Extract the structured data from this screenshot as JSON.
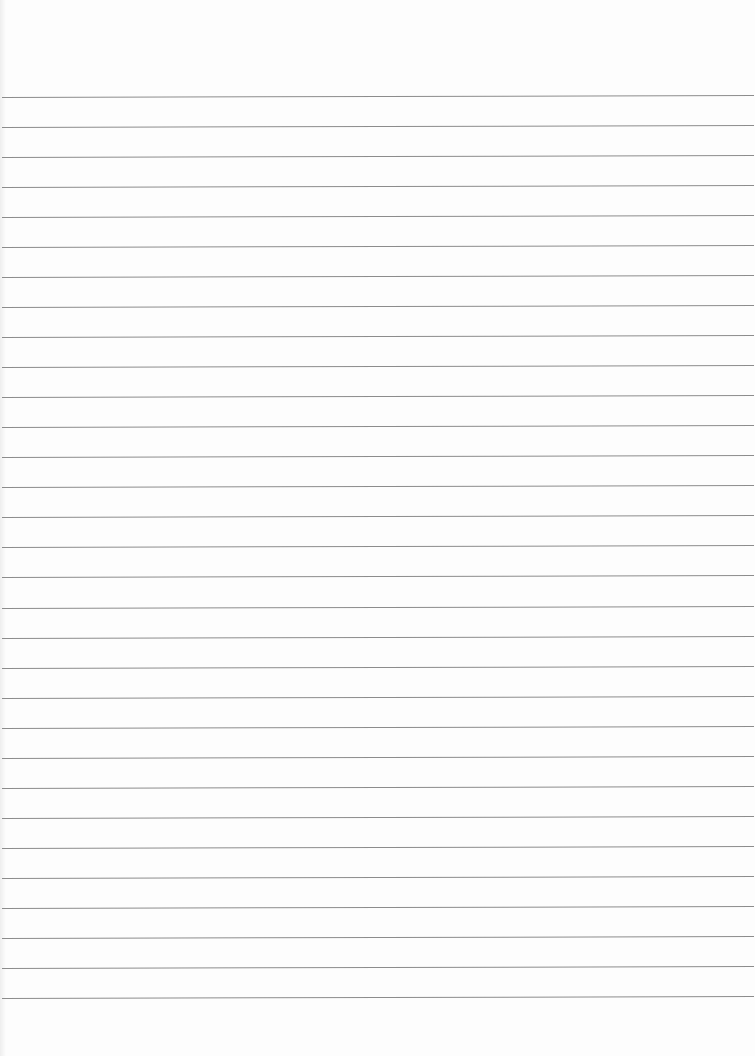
{
  "page": {
    "type": "blank lined paper",
    "background_color": "#fdfdfd",
    "rule_color": "#8c8c8c",
    "rule_count": 31,
    "first_rule_y": 97,
    "rule_spacing": 30.03
  }
}
